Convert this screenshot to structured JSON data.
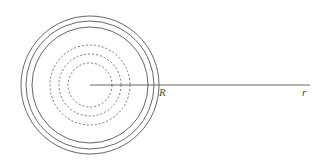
{
  "figure": {
    "kind": "concentric-circles-radial-diagram",
    "width": 315,
    "height": 164,
    "background_color": "#ffffff",
    "stroke_color": "#555555",
    "center": {
      "x": 90,
      "y": 85
    },
    "labels": {
      "outer_radius_label": "R",
      "radial_axis_label": "r"
    },
    "solid_circles": {
      "count": 3,
      "style": "solid",
      "stroke_color": "#555555",
      "stroke_width": 0.9,
      "radii": [
        58,
        64,
        69
      ]
    },
    "dashed_circles": {
      "count": 3,
      "style": "dashed",
      "stroke_color": "#666666",
      "stroke_width": 0.9,
      "dash_pattern": "2 2",
      "radii": [
        22,
        31,
        40
      ]
    },
    "radial_line": {
      "style": "solid",
      "stroke_color": "#555555",
      "stroke_width": 0.9,
      "from": {
        "x": 90,
        "y": 85
      },
      "to": {
        "x": 310,
        "y": 85
      }
    }
  }
}
